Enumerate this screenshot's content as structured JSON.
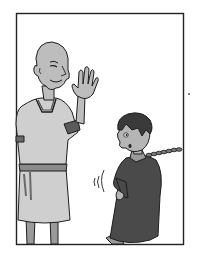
{
  "image": {
    "kind": "comic-panel",
    "style": "grayscale ink illustration",
    "width": 199,
    "height": 258
  },
  "panel": {
    "border": {
      "left": 16,
      "top": 13,
      "right": 183,
      "bottom": 244,
      "color": "#222222"
    },
    "background": "#ffffff"
  },
  "characters": [
    {
      "name": "bald-man",
      "description": "Bald man in light gray tunic with dark trim, raising right hand in a wave",
      "tunic_color": "#c8c8c8",
      "skin_color": "#bdbdbd",
      "trim_color": "#555555"
    },
    {
      "name": "chained-boy",
      "description": "Boy with dark hair in dark robe, chain attached at neck leading to right panel edge, leaning back",
      "robe_color": "#4a4a4a",
      "skin_color": "#b5b5b5",
      "hair_color": "#3a3a3a"
    }
  ],
  "effects": [
    {
      "name": "motion-lines",
      "description": "Curved shake lines left of the boy"
    }
  ],
  "stray_mark": {
    "x": 189,
    "y": 94
  }
}
